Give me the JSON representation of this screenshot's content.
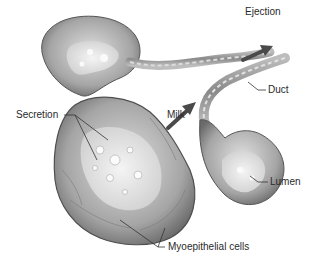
{
  "diagram": {
    "type": "anatomical-illustration",
    "labels": {
      "ejection": "Ejection",
      "duct": "Duct",
      "secretion": "Secretion",
      "milk": "Milk",
      "lumen": "Lumen",
      "myoepithelial": "Myoepithelial cells"
    },
    "colors": {
      "tissue_dark": "#6e6e6e",
      "tissue_mid": "#a8a8a8",
      "tissue_light": "#d8d8d8",
      "lumen": "#eeeeee",
      "arrow": "#4a4a4a",
      "leader": "#333333",
      "text": "#2a2a2a"
    }
  }
}
